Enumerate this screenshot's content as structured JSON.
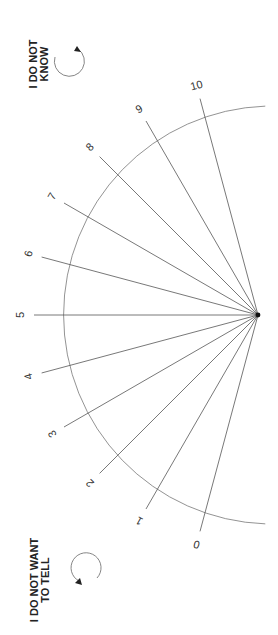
{
  "scale": {
    "min": 0,
    "max": 10,
    "ticks": [
      "0",
      "1",
      "2",
      "3",
      "4",
      "5",
      "6",
      "7",
      "8",
      "9",
      "10"
    ],
    "start_angle_deg": 105,
    "step_deg": 15,
    "center": [
      258,
      315
    ],
    "radius": 209,
    "ray_length": 224,
    "label_radius": 238,
    "line_color": "#555555",
    "arc_color": "#777777"
  },
  "options": {
    "dont_know": {
      "line1": "I DO NOT",
      "line2": "KNOW"
    },
    "dont_want": {
      "line1": "I DO NOT WANT",
      "line2": "TO TELL"
    }
  }
}
